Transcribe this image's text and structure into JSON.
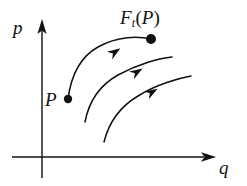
{
  "figure": {
    "kind": "phase-space-flow-diagram",
    "background_color": "#ffffff",
    "ink_color": "#111111"
  },
  "axes": {
    "vertical": {
      "label": "p",
      "name": "momentum-axis",
      "has_arrowhead": true,
      "x": 42,
      "y_top": 20,
      "y_bottom": 178
    },
    "horizontal": {
      "label": "q",
      "name": "position-axis",
      "has_arrowhead": true,
      "y": 157,
      "x_left": 12,
      "x_right": 215
    }
  },
  "points": [
    {
      "name": "point-p",
      "label": "P",
      "label_position": "left",
      "cx": 68,
      "cy": 99,
      "r": 4.2
    },
    {
      "name": "point-ft-p",
      "label": "F_t(P)",
      "label_position": "above",
      "cx": 151,
      "cy": 39,
      "r": 5.0
    }
  ],
  "labels": {
    "ftp": {
      "function_name": "F",
      "subscript": "t",
      "open_paren": "(",
      "argument": "P",
      "close_paren": ")"
    },
    "point_p": "P",
    "axis_p": "p",
    "axis_q": "q"
  },
  "chart_data": {
    "type": "line",
    "title": "",
    "xlabel": "q",
    "ylabel": "p",
    "grid": false,
    "legend": null,
    "annotations": [
      {
        "text": "P",
        "x": 68,
        "y": 99
      },
      {
        "text": "F_t(P)",
        "x": 151,
        "y": 39
      }
    ],
    "series": [
      {
        "name": "trajectory-1",
        "note": "flow line from P to F_t(P)",
        "path": "M68,99 C71,76 80,57 98,47 C118,36 138,36 151,39",
        "arrow_at": {
          "x": 115,
          "y": 52,
          "angle_deg": -34
        }
      },
      {
        "name": "trajectory-2",
        "note": "middle flow line",
        "path": "M85,122 C89,101 100,85 118,75 C138,64 160,58 172,57",
        "arrow_at": {
          "x": 137,
          "y": 72,
          "angle_deg": -32
        }
      },
      {
        "name": "trajectory-3",
        "note": "lower flow line",
        "path": "M104,142 C109,122 121,106 138,96 C157,84 180,78 191,76",
        "arrow_at": {
          "x": 152,
          "y": 92,
          "angle_deg": -31
        }
      }
    ]
  }
}
